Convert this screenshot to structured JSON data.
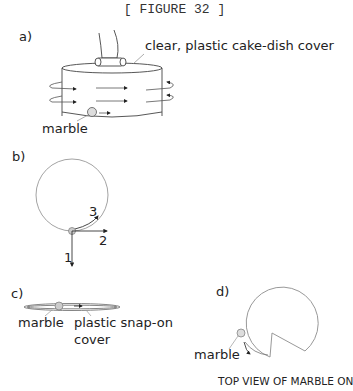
{
  "title": "[ FIGURE 32 ]",
  "panels": {
    "a": {
      "label": "a)",
      "callout": "clear, plastic cake-dish cover",
      "marble_label": "marble"
    },
    "b": {
      "label": "b)",
      "arrow_labels": [
        "1",
        "2",
        "3"
      ]
    },
    "c": {
      "label": "c)",
      "marble_label": "marble",
      "cover_label_line1": "plastic snap-on",
      "cover_label_line2": "cover"
    },
    "d": {
      "label": "d)",
      "marble_label": "marble",
      "caption": "TOP VIEW OF MARBLE ON"
    }
  },
  "colors": {
    "line": "#333333",
    "light_line": "#999999",
    "marble_fill": "#cccccc"
  }
}
